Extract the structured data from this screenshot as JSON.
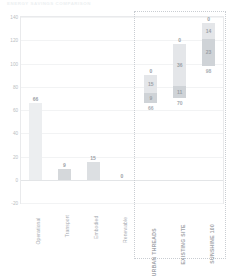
{
  "chart_title": "ENERGY SAVINGS COMPARISON",
  "chart_data": {
    "type": "bar",
    "title": "ENERGY SAVINGS COMPARISON",
    "xlabel": "",
    "ylabel": "",
    "ylim": [
      -20,
      140
    ],
    "yticks": [
      -20,
      0,
      20,
      40,
      60,
      80,
      100,
      120,
      140
    ],
    "ytick_labels": [
      "-20",
      "0",
      "20",
      "40",
      "60",
      "80",
      "100",
      "120",
      "140"
    ],
    "grid": true,
    "legend": "none",
    "categories": [
      "Operational",
      "Transport",
      "Embodied",
      "Renewable",
      "URBAN THREADS",
      "EXISTING SITE",
      "SUNSHINE 100"
    ],
    "groups": [
      {
        "name": "components",
        "stacked": false,
        "bars": [
          {
            "category": "Operational",
            "value": 66,
            "label": "66",
            "color": "#eceef0"
          },
          {
            "category": "Transport",
            "value": 9,
            "label": "9",
            "color": "#d5d8db"
          },
          {
            "category": "Embodied",
            "value": 15,
            "label": "15",
            "color": "#dcdfe2"
          },
          {
            "category": "Renewable",
            "value": 0,
            "label": "0",
            "color": "#e6e8ea"
          }
        ]
      },
      {
        "name": "totals",
        "stacked": true,
        "highlighted": true,
        "bars": [
          {
            "category": "URBAN THREADS",
            "base": 66,
            "base_label": "66",
            "total": 90,
            "segments": [
              {
                "value": 9,
                "label": "9",
                "color": "#cfd3d7"
              },
              {
                "value": 15,
                "label": "15",
                "color": "#e4e6e9"
              },
              {
                "value": 0,
                "label": "0",
                "color": "#f1f2f4"
              }
            ]
          },
          {
            "category": "EXISTING SITE",
            "base": 70,
            "base_label": "70",
            "total": 117,
            "segments": [
              {
                "value": 11,
                "label": "11",
                "color": "#cfd3d7"
              },
              {
                "value": 36,
                "label": "36",
                "color": "#e4e6e9"
              },
              {
                "value": 0,
                "label": "0",
                "color": "#f1f2f4"
              }
            ]
          },
          {
            "category": "SUNSHINE 100",
            "base": 98,
            "base_label": "98",
            "total": 135,
            "segments": [
              {
                "value": 23,
                "label": "23",
                "color": "#cfd3d7"
              },
              {
                "value": 14,
                "label": "14",
                "color": "#e4e6e9"
              },
              {
                "value": 0,
                "label": "0",
                "color": "#f1f2f4"
              }
            ]
          }
        ]
      }
    ],
    "annotations": [
      {
        "type": "dotted-rect",
        "from_category": "URBAN THREADS",
        "to_category": "SUNSHINE 100"
      }
    ]
  },
  "colors": {
    "axis": "#e9eaec",
    "grid": "#f2f3f4",
    "tick_text": "#b9bdc1",
    "label_text": "#9aa0a6",
    "dotted": "#c9cdd2",
    "background": "#ffffff"
  }
}
